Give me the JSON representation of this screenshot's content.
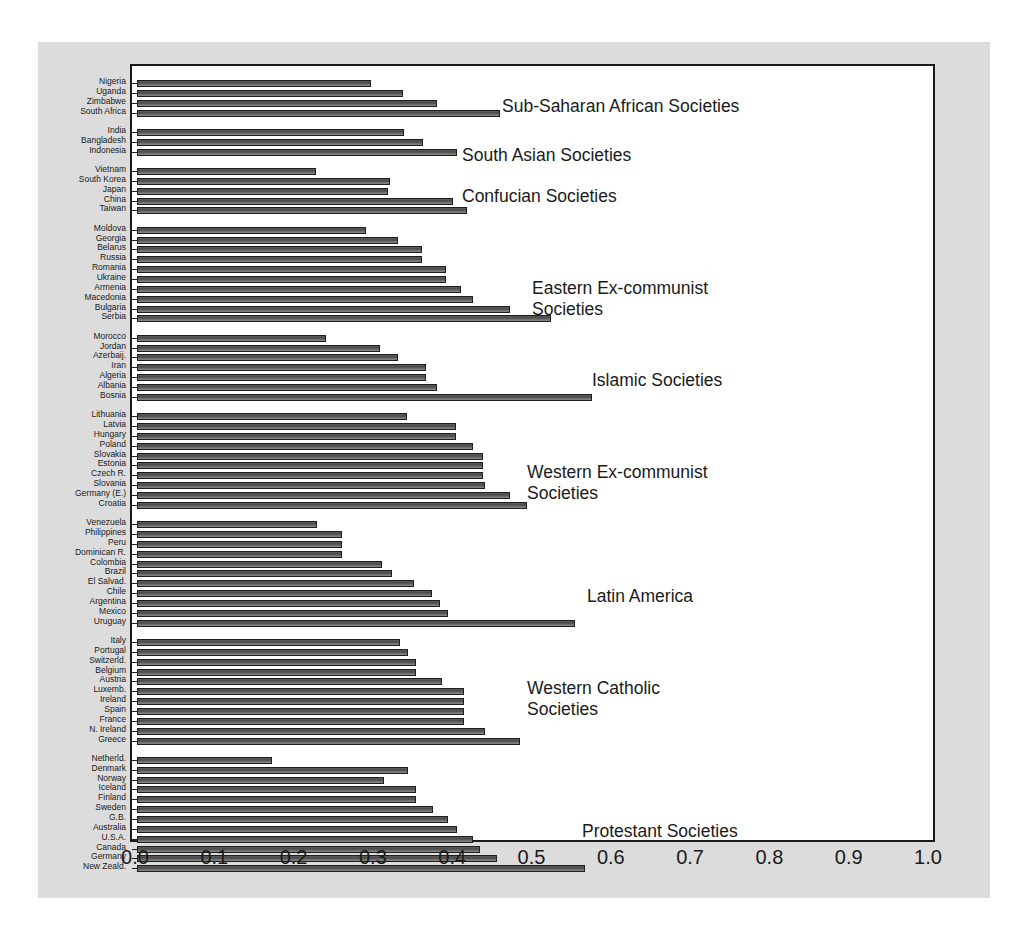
{
  "chart_data": {
    "type": "bar",
    "orientation": "horizontal",
    "title": "",
    "xlabel": "",
    "ylabel": "",
    "xlim": [
      0.0,
      1.0
    ],
    "xticks": [
      "0.0",
      "0.1",
      "0.2",
      "0.3",
      "0.4",
      "0.5",
      "0.6",
      "0.7",
      "0.8",
      "0.9",
      "1.0"
    ],
    "grid": false,
    "legend": "none",
    "annotations_position": "inside-right",
    "groups": [
      {
        "label": "Sub-Saharan African Societies",
        "categories": [
          "Nigeria",
          "Uganda",
          "Zimbabwe",
          "South Africa"
        ],
        "values": [
          0.295,
          0.335,
          0.378,
          0.458
        ]
      },
      {
        "label": "South Asian Societies",
        "categories": [
          "India",
          "Bangladesh",
          "Indonesia"
        ],
        "values": [
          0.337,
          0.361,
          0.404
        ]
      },
      {
        "label": "Confucian Societies",
        "categories": [
          "Vietnam",
          "South Korea",
          "Japan",
          "China",
          "Taiwan"
        ],
        "values": [
          0.226,
          0.319,
          0.316,
          0.398,
          0.416
        ]
      },
      {
        "label": "Eastern Ex-communist\nSocieties",
        "categories": [
          "Moldova",
          "Georgia",
          "Belarus",
          "Russia",
          "Romania",
          "Ukraine",
          "Armenia",
          "Macedonia",
          "Bulgaria",
          "Serbia"
        ],
        "values": [
          0.289,
          0.329,
          0.359,
          0.359,
          0.39,
          0.39,
          0.408,
          0.424,
          0.47,
          0.522
        ]
      },
      {
        "label": "Islamic Societies",
        "categories": [
          "Morocco",
          "Jordan",
          "Azerbaij.",
          "Iran",
          "Algeria",
          "Albania",
          "Bosnia"
        ],
        "values": [
          0.238,
          0.306,
          0.329,
          0.364,
          0.364,
          0.378,
          0.574
        ]
      },
      {
        "label": "Western Ex-communist\nSocieties",
        "categories": [
          "Lithuania",
          "Latvia",
          "Hungary",
          "Poland",
          "Slovakia",
          "Estonia",
          "Czech R.",
          "Slovania",
          "Germany (E.)",
          "Croatia"
        ],
        "values": [
          0.34,
          0.402,
          0.402,
          0.424,
          0.436,
          0.436,
          0.436,
          0.439,
          0.47,
          0.492
        ]
      },
      {
        "label": "Latin America",
        "categories": [
          "Venezuela",
          "Philippines",
          "Peru",
          "Dominican R.",
          "Colombia",
          "Brazil",
          "El Salvad.",
          "Chile",
          "Argentina",
          "Mexico",
          "Uruguay"
        ],
        "values": [
          0.227,
          0.258,
          0.258,
          0.258,
          0.309,
          0.321,
          0.349,
          0.372,
          0.382,
          0.392,
          0.552
        ]
      },
      {
        "label": "Western Catholic\nSocieties",
        "categories": [
          "Italy",
          "Portugal",
          "Switzerld.",
          "Belgium",
          "Austria",
          "Luxemb.",
          "Ireland",
          "Spain",
          "France",
          "N. Ireland",
          "Greece"
        ],
        "values": [
          0.332,
          0.342,
          0.352,
          0.352,
          0.385,
          0.412,
          0.412,
          0.412,
          0.412,
          0.439,
          0.483
        ]
      },
      {
        "label": "Protestant Societies",
        "categories": [
          "Netherld.",
          "Denmark",
          "Norway",
          "Iceland",
          "Finland",
          "Sweden",
          "G.B.",
          "Australia",
          "U.S.A.",
          "Canada",
          "Germany",
          "New Zeald."
        ],
        "values": [
          0.17,
          0.342,
          0.311,
          0.352,
          0.352,
          0.373,
          0.392,
          0.404,
          0.424,
          0.432,
          0.454,
          0.565
        ]
      }
    ]
  },
  "style": {
    "panel_bg": "#dcdcdc",
    "plot_bg": "#ffffff",
    "bar_color": "#5a5a5a",
    "frame_color": "#1a1a1a",
    "text_color": "#1a1a1a"
  }
}
